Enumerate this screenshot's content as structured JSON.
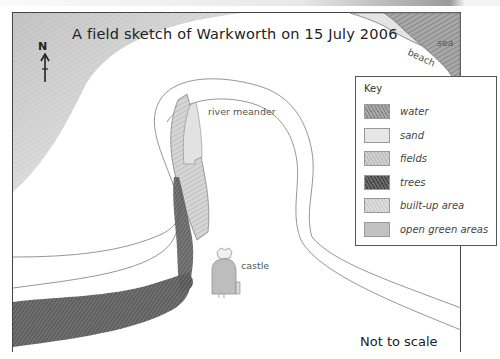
{
  "map": {
    "title": "A field sketch of Warkworth on 15 July 2006",
    "north_arrow": {
      "label": "N",
      "icon": "north-arrow-icon"
    },
    "features": {
      "river": "river meander",
      "castle": "castle",
      "sea": "sea",
      "beach": "beach"
    },
    "scale_note": "Not to scale"
  },
  "key": {
    "title": "Key",
    "items": [
      {
        "label": "water",
        "color": "#9c9c9c",
        "pattern": "hatched"
      },
      {
        "label": "sand",
        "color": "#e6e6e6",
        "pattern": "light"
      },
      {
        "label": "fields",
        "color": "#c8c8c8",
        "pattern": "medium"
      },
      {
        "label": "trees",
        "color": "#5c5c5c",
        "pattern": "dark-hatched"
      },
      {
        "label": "built-up area",
        "color": "#d8d8d8",
        "pattern": "light-hatched"
      },
      {
        "label": "open green areas",
        "color": "#c0c0c0",
        "pattern": "solid"
      }
    ]
  },
  "colors": {
    "border": "#444444",
    "pencil_line": "#8a8a8a",
    "shading_light": "#cfcfcf",
    "shading_dark": "#5a5a5a"
  }
}
